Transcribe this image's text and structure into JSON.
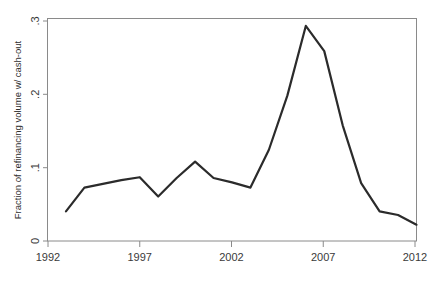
{
  "chart_data": {
    "type": "line",
    "title": "",
    "xlabel": "",
    "ylabel": "Fraction of refinancing volume w/ cash-out",
    "xlim": [
      1992,
      2012
    ],
    "ylim": [
      0,
      0.3
    ],
    "grid": false,
    "legend": null,
    "x_ticks": [
      "1992",
      "1997",
      "2002",
      "2007",
      "2012"
    ],
    "x_tick_values": [
      1992,
      1997,
      2002,
      2007,
      2012
    ],
    "y_ticks": [
      "0",
      ".1",
      ".2",
      ".3"
    ],
    "y_tick_values": [
      0,
      0.1,
      0.2,
      0.3
    ],
    "series": [
      {
        "name": "Fraction of refinancing volume w/ cash-out",
        "color": "#2b2b2b",
        "x": [
          1993,
          1994,
          1995,
          1996,
          1997,
          1998,
          1999,
          2000,
          2001,
          2002,
          2003,
          2004,
          2005,
          2006,
          2007,
          2008,
          2009,
          2010,
          2011,
          2012
        ],
        "values": [
          0.04,
          0.072,
          0.077,
          0.082,
          0.086,
          0.06,
          0.085,
          0.107,
          0.085,
          0.079,
          0.072,
          0.123,
          0.196,
          0.29,
          0.256,
          0.156,
          0.078,
          0.04,
          0.035,
          0.022
        ]
      }
    ]
  },
  "axes": {
    "y_axis_title": "Fraction of refinancing volume w/ cash-out"
  },
  "colors": {
    "line": "#2b2b2b",
    "axis": "#8a8a8a",
    "text": "#2e2e2e",
    "background": "#ffffff"
  }
}
